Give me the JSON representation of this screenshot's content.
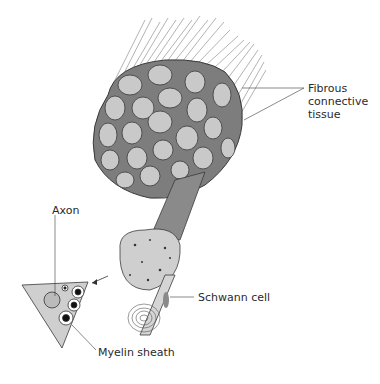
{
  "diagram": {
    "labels": {
      "fibrous_connective_tissue_line1": "Fibrous",
      "fibrous_connective_tissue_line2": "connective",
      "fibrous_connective_tissue_line3": "tissue",
      "axon": "Axon",
      "schwann_cell": "Schwann cell",
      "myelin_sheath": "Myelin sheath"
    },
    "colors": {
      "background": "#ffffff",
      "connective_tissue": "#7d7d7d",
      "fascicle_fill": "#c9c9c9",
      "outline": "#3a3a3a",
      "fiber_lines": "#9a9a9a",
      "schwann_cell": "#8a8a8a",
      "axon_core": "#111111",
      "label_text": "#2a2a2a"
    }
  }
}
